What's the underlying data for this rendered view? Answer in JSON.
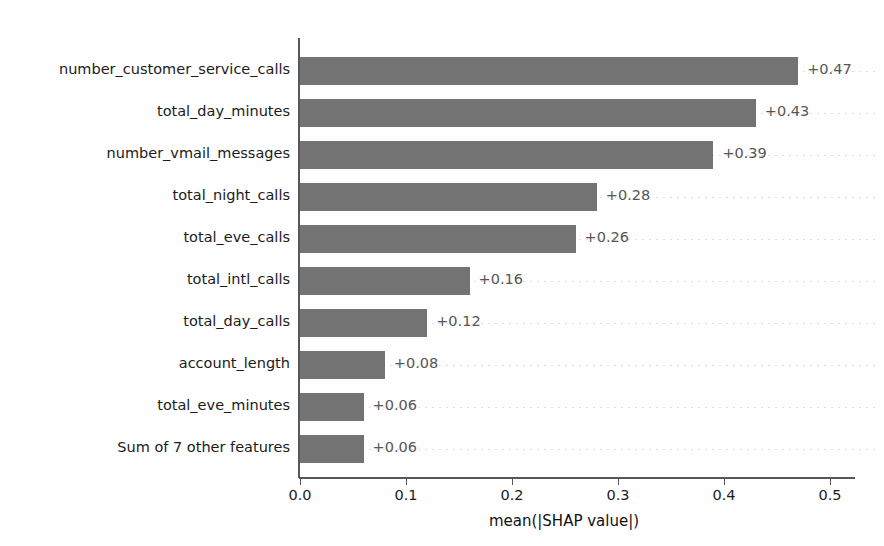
{
  "chart_data": {
    "type": "bar",
    "orientation": "horizontal",
    "title": "",
    "xlabel": "mean(|SHAP value|)",
    "ylabel": "",
    "xlim": [
      0.0,
      0.5
    ],
    "xticks": [
      "0.0",
      "0.1",
      "0.2",
      "0.3",
      "0.4",
      "0.5"
    ],
    "xtick_values": [
      0.0,
      0.1,
      0.2,
      0.3,
      0.4,
      0.5
    ],
    "grid": "horizontal-dotted-faint",
    "legend": "none",
    "bar_color": "#737373",
    "value_label_color": "#565656",
    "categories": [
      "number_customer_service_calls",
      "total_day_minutes",
      "number_vmail_messages",
      "total_night_calls",
      "total_eve_calls",
      "total_intl_calls",
      "total_day_calls",
      "account_length",
      "total_eve_minutes",
      "Sum of 7 other features"
    ],
    "values": [
      0.47,
      0.43,
      0.39,
      0.28,
      0.26,
      0.16,
      0.12,
      0.08,
      0.06,
      0.06
    ],
    "value_labels": [
      "+0.47",
      "+0.43",
      "+0.39",
      "+0.28",
      "+0.26",
      "+0.16",
      "+0.12",
      "+0.08",
      "+0.06",
      "+0.06"
    ]
  }
}
